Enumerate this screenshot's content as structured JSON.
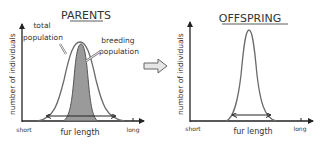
{
  "left_panel": {
    "title": "PARENTS",
    "y_axis_label": "number of individuals",
    "x_axis_label": "fur length",
    "x_min_label": "short",
    "x_max_label": "long",
    "annotations": {
      "total_line1": "total",
      "total_line2": "population",
      "breeding_line1": "breeding",
      "breeding_line2": "population"
    }
  },
  "transition_arrow": "arrow-right-icon",
  "right_panel": {
    "title": "OFFSPRING",
    "y_axis_label": "number of individuals",
    "x_axis_label": "fur length",
    "x_min_label": "short",
    "x_max_label": "long"
  },
  "colors": {
    "line": "#333333",
    "curve": "#6b6b6b",
    "shaded": "#9a9a9a",
    "arrow_fill": "#e6e6e6"
  }
}
